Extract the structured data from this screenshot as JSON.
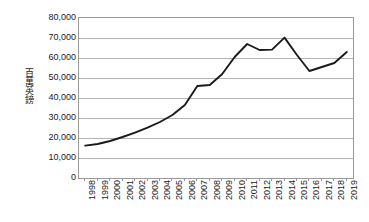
{
  "chart_data": {
    "type": "line",
    "title": "",
    "xlabel": "",
    "ylabel": "百萬英鎊",
    "ylim": [
      0,
      80000
    ],
    "ytick_labels": [
      "80,000",
      "70,000",
      "60,000",
      "50,000",
      "40,000",
      "30,000",
      "20,000",
      "10,000",
      "0"
    ],
    "ytick_values": [
      80000,
      70000,
      60000,
      50000,
      40000,
      30000,
      20000,
      10000,
      0
    ],
    "grid": true,
    "legend": "none",
    "line_color": "#1a1a1a",
    "grid_color": "#b4b4b4",
    "axis_color": "#9a9a9a",
    "categories": [
      "1998",
      "1999",
      "2000",
      "2001",
      "2002",
      "2003",
      "2004",
      "2005",
      "2006",
      "2007",
      "2008",
      "2009",
      "2010",
      "2011",
      "2012",
      "2013",
      "2014",
      "2015",
      "2016",
      "2017",
      "2018",
      "2019"
    ],
    "values": [
      16200,
      17000,
      18500,
      20500,
      22700,
      25200,
      28000,
      31500,
      36500,
      46000,
      46500,
      52000,
      60500,
      67000,
      64000,
      64200,
      70200,
      61500,
      53500,
      55500,
      57500,
      63000
    ]
  }
}
